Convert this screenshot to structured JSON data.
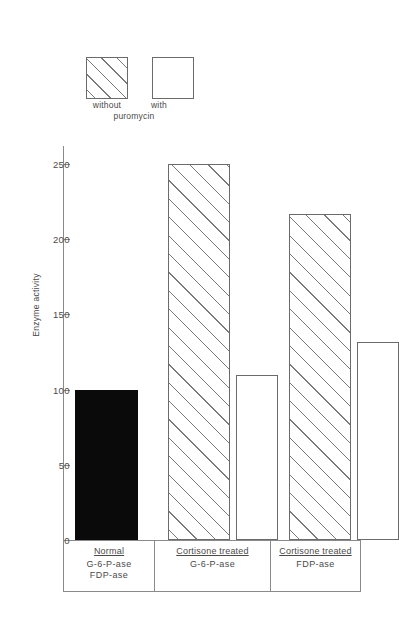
{
  "chart_data": {
    "type": "bar",
    "title": "",
    "xlabel": "",
    "ylabel": "Enzyme activity",
    "ylim": [
      0,
      262
    ],
    "yticks": [
      0,
      50,
      100,
      150,
      200,
      250
    ],
    "ytick_labels": [
      "0",
      "50",
      "100",
      "150",
      "200",
      "250"
    ],
    "grid": false,
    "legend": {
      "position": "top-left",
      "entries": [
        {
          "label_line1": "without",
          "pattern": "hatched"
        },
        {
          "label_line1": "with",
          "pattern": "open"
        }
      ],
      "shared_label_line2": "puromycin"
    },
    "groups": [
      {
        "head": "Normal",
        "sub_lines": [
          "G-6-P-ase",
          "FDP-ase"
        ],
        "bars": [
          {
            "series": "normal-reference",
            "value": 100,
            "pattern": "solid"
          }
        ]
      },
      {
        "head": "Cortisone treated",
        "sub_lines": [
          "G-6-P-ase"
        ],
        "bars": [
          {
            "series": "without puromycin",
            "value": 250,
            "pattern": "hatched"
          },
          {
            "series": "with puromycin",
            "value": 110,
            "pattern": "open"
          }
        ]
      },
      {
        "head": "Cortisone treated",
        "sub_lines": [
          "FDP-ase"
        ],
        "bars": [
          {
            "series": "without puromycin",
            "value": 217,
            "pattern": "hatched"
          },
          {
            "series": "with puromycin",
            "value": 132,
            "pattern": "open"
          }
        ]
      }
    ],
    "categories": [
      "Normal G-6-P-ase FDP-ase",
      "Cortisone treated G-6-P-ase",
      "Cortisone treated FDP-ase"
    ],
    "series": [
      {
        "name": "without puromycin",
        "values": [
          100,
          250,
          217
        ]
      },
      {
        "name": "with puromycin",
        "values": [
          null,
          110,
          132
        ]
      }
    ],
    "colors": {
      "line": "#6b6b6b",
      "solid_fill": "#0a0a0a",
      "open_fill": "#ffffff",
      "hatch_stroke": "#7a7a7a",
      "text": "#4a4a4a"
    }
  }
}
